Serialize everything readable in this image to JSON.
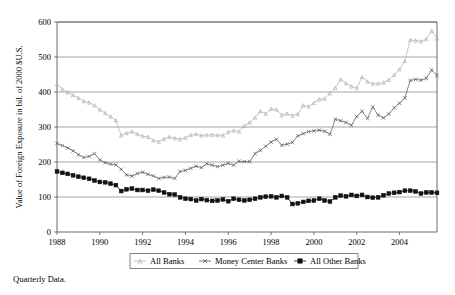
{
  "caption": "Quarterly Data.",
  "chart_data": {
    "type": "line",
    "title": "",
    "xlabel": "",
    "ylabel": "Value of Foreign Exposure in bil. of 2000 $U.S.",
    "xlim": [
      1988.0,
      2005.75
    ],
    "ylim": [
      0,
      600
    ],
    "ytick_values": [
      0,
      100,
      200,
      300,
      400,
      500,
      600
    ],
    "ytick_labels": [
      "0",
      "100",
      "200",
      "300",
      "400",
      "500",
      "600"
    ],
    "xtick_values": [
      1988,
      1990,
      1992,
      1994,
      1996,
      1998,
      2000,
      2002,
      2004
    ],
    "xtick_labels": [
      "1988",
      "1990",
      "1992",
      "1994",
      "1996",
      "1998",
      "2000",
      "2002",
      "2004"
    ],
    "grid": "horizontal",
    "legend_position": "bottom-center",
    "frequency": "quarterly",
    "x": [
      1988.0,
      1988.25,
      1988.5,
      1988.75,
      1989.0,
      1989.25,
      1989.5,
      1989.75,
      1990.0,
      1990.25,
      1990.5,
      1990.75,
      1991.0,
      1991.25,
      1991.5,
      1991.75,
      1992.0,
      1992.25,
      1992.5,
      1992.75,
      1993.0,
      1993.25,
      1993.5,
      1993.75,
      1994.0,
      1994.25,
      1994.5,
      1994.75,
      1995.0,
      1995.25,
      1995.5,
      1995.75,
      1996.0,
      1996.25,
      1996.5,
      1996.75,
      1997.0,
      1997.25,
      1997.5,
      1997.75,
      1998.0,
      1998.25,
      1998.5,
      1998.75,
      1999.0,
      1999.25,
      1999.5,
      1999.75,
      2000.0,
      2000.25,
      2000.5,
      2000.75,
      2001.0,
      2001.25,
      2001.5,
      2001.75,
      2002.0,
      2002.25,
      2002.5,
      2002.75,
      2003.0,
      2003.25,
      2003.5,
      2003.75,
      2004.0,
      2004.25,
      2004.5,
      2004.75,
      2005.0,
      2005.25,
      2005.5,
      2005.75
    ],
    "series": [
      {
        "name": "All Banks",
        "marker": "triangle",
        "color": "#b0b0b0",
        "values": [
          422,
          408,
          399,
          391,
          383,
          374,
          370,
          362,
          350,
          340,
          330,
          319,
          276,
          283,
          287,
          280,
          274,
          272,
          262,
          258,
          266,
          272,
          268,
          265,
          270,
          277,
          280,
          276,
          277,
          278,
          277,
          276,
          286,
          290,
          287,
          303,
          313,
          327,
          345,
          338,
          352,
          350,
          334,
          338,
          333,
          337,
          362,
          359,
          369,
          379,
          381,
          396,
          412,
          436,
          425,
          416,
          411,
          443,
          430,
          424,
          424,
          427,
          435,
          449,
          465,
          489,
          549,
          547,
          545,
          551,
          575,
          553
        ]
      },
      {
        "name": "Money Center Banks",
        "marker": "x",
        "color": "#555555",
        "values": [
          253,
          247,
          240,
          232,
          221,
          213,
          216,
          224,
          206,
          198,
          194,
          192,
          179,
          163,
          160,
          167,
          171,
          165,
          160,
          153,
          156,
          157,
          153,
          173,
          176,
          182,
          188,
          184,
          195,
          191,
          187,
          191,
          196,
          191,
          202,
          201,
          201,
          224,
          233,
          245,
          257,
          265,
          248,
          251,
          256,
          275,
          281,
          287,
          289,
          291,
          288,
          279,
          322,
          318,
          313,
          305,
          330,
          345,
          324,
          357,
          334,
          326,
          337,
          355,
          368,
          383,
          433,
          436,
          434,
          439,
          463,
          447
        ]
      },
      {
        "name": "All Other Banks",
        "marker": "square",
        "color": "#111111",
        "values": [
          173,
          169,
          166,
          162,
          158,
          155,
          152,
          147,
          143,
          142,
          138,
          134,
          117,
          122,
          124,
          120,
          120,
          118,
          121,
          118,
          113,
          108,
          107,
          99,
          95,
          94,
          90,
          94,
          91,
          89,
          90,
          93,
          88,
          95,
          92,
          90,
          92,
          95,
          99,
          101,
          102,
          99,
          103,
          99,
          80,
          82,
          86,
          89,
          90,
          95,
          90,
          87,
          99,
          104,
          102,
          106,
          103,
          106,
          100,
          98,
          99,
          105,
          110,
          112,
          114,
          118,
          118,
          116,
          110,
          113,
          113,
          112
        ]
      }
    ]
  }
}
